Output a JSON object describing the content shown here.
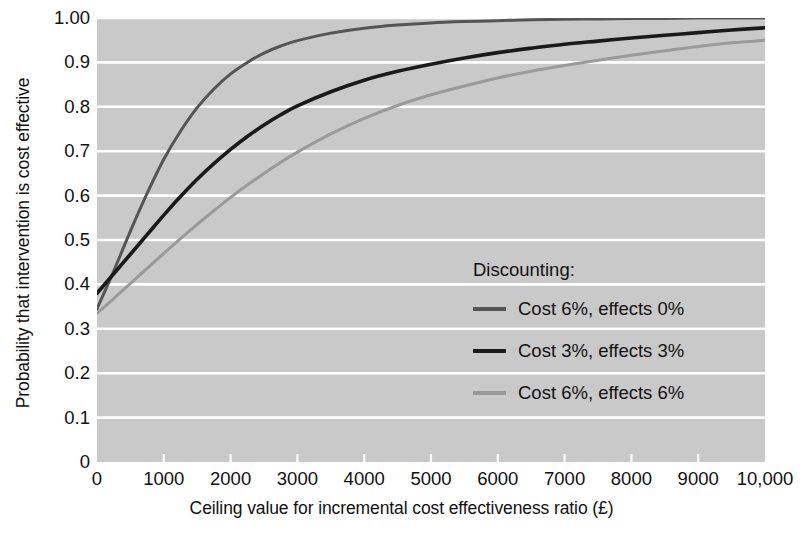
{
  "chart_data": {
    "type": "line",
    "title": "",
    "xlabel": "Ceiling value for incremental cost effectiveness ratio (£)",
    "ylabel": "Probability that intervention is cost effective",
    "xlim": [
      0,
      10000
    ],
    "ylim": [
      0,
      1.0
    ],
    "grid": true,
    "grid_color": "#ffffff",
    "plot_background": "#c9c9c9",
    "legend_position": "inside-right-middle",
    "legend_title": "Discounting:",
    "xticks": [
      0,
      1000,
      2000,
      3000,
      4000,
      5000,
      6000,
      7000,
      8000,
      9000,
      10000
    ],
    "xticklabels": [
      "0",
      "1000",
      "2000",
      "3000",
      "4000",
      "5000",
      "6000",
      "7000",
      "8000",
      "9000",
      "10,000"
    ],
    "yticks": [
      0,
      0.1,
      0.2,
      0.3,
      0.4,
      0.5,
      0.6,
      0.7,
      0.8,
      0.9,
      1.0
    ],
    "yticklabels": [
      "0",
      "0.1",
      "0.2",
      "0.3",
      "0.4",
      "0.5",
      "0.6",
      "0.7",
      "0.8",
      "0.9",
      "1.00"
    ],
    "x": [
      0,
      250,
      500,
      750,
      1000,
      1250,
      1500,
      1750,
      2000,
      2250,
      2500,
      2750,
      3000,
      3500,
      4000,
      4500,
      5000,
      5500,
      6000,
      6500,
      7000,
      7500,
      8000,
      8500,
      9000,
      9500,
      10000
    ],
    "series": [
      {
        "name": "Cost 6%, effects 0%",
        "color": "#555555",
        "width": 3.0,
        "values": [
          0.345,
          0.43,
          0.52,
          0.605,
          0.682,
          0.745,
          0.798,
          0.84,
          0.874,
          0.9,
          0.921,
          0.937,
          0.949,
          0.966,
          0.977,
          0.984,
          0.989,
          0.992,
          0.994,
          0.996,
          0.997,
          0.998,
          0.999,
          0.999,
          1.0,
          1.0,
          1.0
        ]
      },
      {
        "name": "Cost 3%, effects 3%",
        "color": "#1a1a1a",
        "width": 3.6,
        "values": [
          0.38,
          0.424,
          0.468,
          0.512,
          0.556,
          0.598,
          0.637,
          0.672,
          0.704,
          0.733,
          0.759,
          0.782,
          0.802,
          0.834,
          0.86,
          0.88,
          0.896,
          0.91,
          0.922,
          0.932,
          0.941,
          0.948,
          0.955,
          0.961,
          0.967,
          0.973,
          0.978
        ]
      },
      {
        "name": "Cost 6%, effects 6%",
        "color": "#9a9a9a",
        "width": 3.0,
        "values": [
          0.335,
          0.368,
          0.402,
          0.436,
          0.47,
          0.503,
          0.535,
          0.566,
          0.596,
          0.624,
          0.65,
          0.675,
          0.698,
          0.739,
          0.774,
          0.803,
          0.827,
          0.847,
          0.865,
          0.88,
          0.893,
          0.905,
          0.916,
          0.926,
          0.936,
          0.944,
          0.95
        ]
      }
    ]
  },
  "legend": {
    "title": "Discounting:",
    "entries": [
      {
        "label": "Cost 6%, effects 0%",
        "color": "#555555"
      },
      {
        "label": "Cost 3%, effects 3%",
        "color": "#1a1a1a"
      },
      {
        "label": "Cost 6%, effects 6%",
        "color": "#9a9a9a"
      }
    ]
  },
  "axes": {
    "y_title": "Probability that intervention is cost effective",
    "x_title": "Ceiling value for incremental cost effectiveness ratio (£)"
  }
}
